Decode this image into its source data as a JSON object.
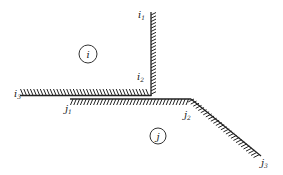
{
  "diagram": {
    "type": "boundary-contact",
    "colors": {
      "line": "#222222",
      "background": "#ffffff"
    },
    "regions": [
      {
        "id": "i",
        "label": "i",
        "cx": 88,
        "cy": 54,
        "r": 9
      },
      {
        "id": "j",
        "label": "j",
        "cx": 158,
        "cy": 136,
        "r": 8
      }
    ],
    "labels": {
      "i1": {
        "base": "i",
        "sub": "1"
      },
      "i2": {
        "base": "i",
        "sub": "2"
      },
      "i3": {
        "base": "i",
        "sub": "3"
      },
      "j1": {
        "base": "j",
        "sub": "1"
      },
      "j2": {
        "base": "j",
        "sub": "2"
      },
      "j3": {
        "base": "j",
        "sub": "3"
      }
    },
    "boundaries": [
      {
        "name": "i-vertical",
        "from": "i1",
        "to": "i2",
        "points": [
          [
            151,
            12
          ],
          [
            151,
            95
          ]
        ],
        "hatch": "right"
      },
      {
        "name": "i-horizontal",
        "from": "i2",
        "to": "i3",
        "points": [
          [
            20,
            95
          ],
          [
            151,
            95
          ]
        ],
        "hatch": "above"
      },
      {
        "name": "j-horizontal",
        "from": "j1",
        "to": "j2",
        "points": [
          [
            70,
            99
          ],
          [
            191,
            99
          ]
        ],
        "hatch": "below"
      },
      {
        "name": "j-diagonal",
        "from": "j2",
        "to": "j3",
        "points": [
          [
            191,
            99
          ],
          [
            261,
            156
          ]
        ],
        "hatch": "below"
      }
    ]
  }
}
